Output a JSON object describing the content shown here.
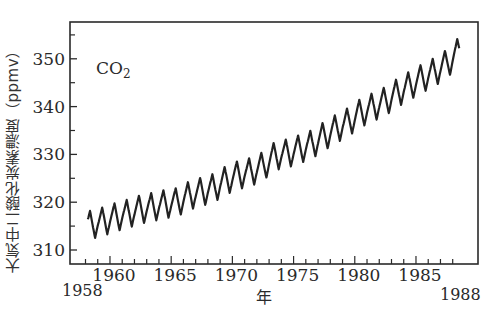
{
  "chart_data": {
    "type": "line",
    "title": "",
    "annotation": "CO2",
    "annotation_main": "CO",
    "annotation_sub": "2",
    "xlabel": "年",
    "ylabel": "大気中二酸化炭素濃度（ppmv）",
    "xlim": [
      1958,
      1988
    ],
    "ylim": [
      307.5,
      358
    ],
    "x_ticks_major": [
      1960,
      1965,
      1970,
      1975,
      1980,
      1985
    ],
    "x_tick_labels": [
      "1960",
      "1965",
      "1970",
      "1975",
      "1980",
      "1985"
    ],
    "x_end_labels": [
      "1958",
      "1988"
    ],
    "y_ticks_major": [
      310,
      320,
      330,
      340,
      350
    ],
    "y_tick_labels": [
      "310",
      "320",
      "330",
      "340",
      "350"
    ],
    "y_ticks_minor": [
      315,
      325,
      335,
      345,
      355
    ],
    "grid": false,
    "legend": null,
    "series": [
      {
        "name": "CO2 (Mauna Loa, monthly)",
        "color": "#222222",
        "seasonal_amplitude_ppmv": 6,
        "annual_mean": {
          "x": [
            1958,
            1959,
            1960,
            1961,
            1962,
            1963,
            1964,
            1965,
            1966,
            1967,
            1968,
            1969,
            1970,
            1971,
            1972,
            1973,
            1974,
            1975,
            1976,
            1977,
            1978,
            1979,
            1980,
            1981,
            1982,
            1983,
            1984,
            1985,
            1986,
            1987,
            1988
          ],
          "y": [
            315.3,
            316.0,
            316.9,
            317.6,
            318.5,
            319.0,
            319.6,
            320.0,
            321.4,
            322.2,
            323.0,
            324.6,
            325.7,
            326.3,
            327.5,
            329.7,
            330.2,
            331.1,
            332.1,
            333.8,
            335.4,
            336.8,
            338.7,
            339.9,
            341.1,
            342.9,
            344.4,
            345.9,
            347.2,
            348.9,
            351.5
          ]
        }
      }
    ]
  }
}
